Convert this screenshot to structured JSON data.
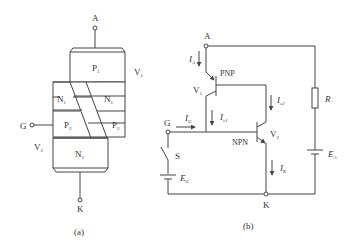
{
  "figure_a": {
    "caption": "(a)",
    "terminal_anode": "A",
    "terminal_gate": "G",
    "terminal_cathode": "K",
    "layer_p1": "P",
    "layer_p1_sub": "1",
    "layer_n1_left": "N",
    "layer_n1_left_sub": "1",
    "layer_n1_right": "N",
    "layer_n1_right_sub": "1",
    "layer_p2_left": "P",
    "layer_p2_left_sub": "2",
    "layer_p2_right": "P",
    "layer_p2_right_sub": "2",
    "layer_n2": "N",
    "layer_n2_sub": "2",
    "transistor_v1": "V",
    "transistor_v1_sub": "1",
    "transistor_v2": "V",
    "transistor_v2_sub": "2"
  },
  "figure_b": {
    "caption": "(b)",
    "terminal_anode": "A",
    "terminal_gate": "G",
    "terminal_cathode": "K",
    "current_anode": "I",
    "current_anode_sub": "A",
    "current_gate": "I",
    "current_gate_sub": "G",
    "current_c1": "I",
    "current_c1_sub": "c1",
    "current_c2": "I",
    "current_c2_sub": "c2",
    "current_cathode": "I",
    "current_cathode_sub": "K",
    "pnp_label": "PNP",
    "npn_label": "NPN",
    "transistor_v1": "V",
    "transistor_v1_sub": "1",
    "transistor_v2": "V",
    "transistor_v2_sub": "2",
    "resistor_label": "R",
    "switch_label": "S",
    "gate_source": "E",
    "gate_source_sub": "G",
    "anode_source": "E",
    "anode_source_sub": "A"
  }
}
